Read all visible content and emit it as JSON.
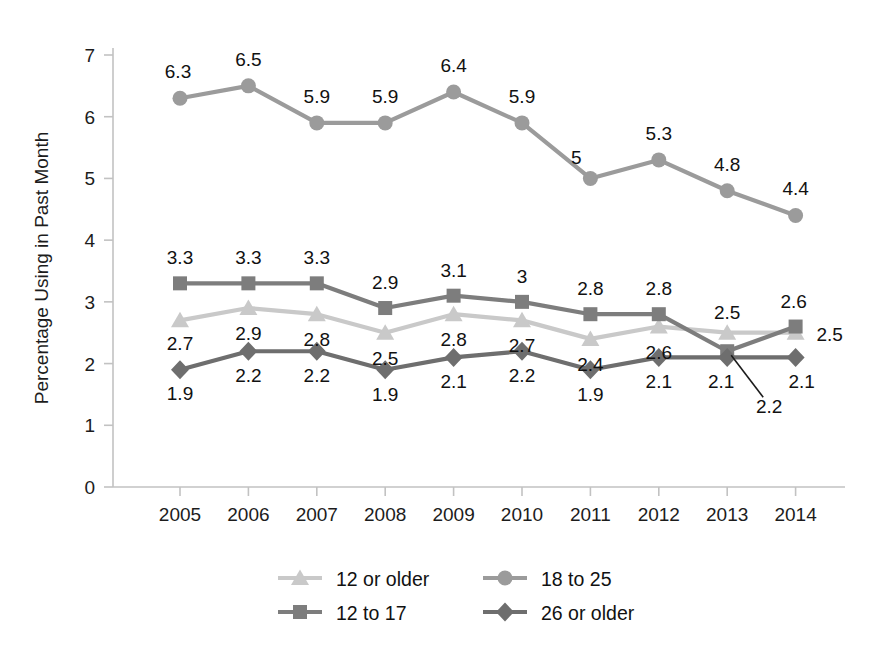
{
  "chart_data": {
    "type": "line",
    "title": "",
    "xlabel": "",
    "ylabel": "Percentage Using in Past Month",
    "categories": [
      "2005",
      "2006",
      "2007",
      "2008",
      "2009",
      "2010",
      "2011",
      "2012",
      "2013",
      "2014"
    ],
    "ylim": [
      0,
      7
    ],
    "yticks": [
      "0",
      "1",
      "2",
      "3",
      "4",
      "5",
      "6",
      "7"
    ],
    "grid": false,
    "legend_position": "bottom",
    "series": [
      {
        "name": "12 or older",
        "marker": "triangle",
        "color": "#c9c9c9",
        "values": [
          2.7,
          2.9,
          2.8,
          2.5,
          2.8,
          2.7,
          2.4,
          2.6,
          2.5,
          2.5
        ],
        "labels": [
          "2.7",
          "2.9",
          "2.8",
          "2.5",
          "2.8",
          "2.7",
          "2.4",
          "2.6",
          "2.5",
          "2.5"
        ]
      },
      {
        "name": "18 to 25",
        "marker": "circle",
        "color": "#9b9b9b",
        "values": [
          6.3,
          6.5,
          5.9,
          5.9,
          6.4,
          5.9,
          5.0,
          5.3,
          4.8,
          4.4
        ],
        "labels": [
          "6.3",
          "6.5",
          "5.9",
          "5.9",
          "6.4",
          "5.9",
          "5",
          "5.3",
          "4.8",
          "4.4"
        ]
      },
      {
        "name": "12 to 17",
        "marker": "square",
        "color": "#7d7d7d",
        "values": [
          3.3,
          3.3,
          3.3,
          2.9,
          3.1,
          3.0,
          2.8,
          2.8,
          2.2,
          2.6
        ],
        "labels": [
          "3.3",
          "3.3",
          "3.3",
          "2.9",
          "3.1",
          "3",
          "2.8",
          "2.8",
          "2.2",
          "2.6"
        ]
      },
      {
        "name": "26 or older",
        "marker": "diamond",
        "color": "#6e6e6e",
        "values": [
          1.9,
          2.2,
          2.2,
          1.9,
          2.1,
          2.2,
          1.9,
          2.1,
          2.1,
          2.1
        ],
        "labels": [
          "1.9",
          "2.2",
          "2.2",
          "1.9",
          "2.1",
          "2.2",
          "1.9",
          "2.1",
          "2.1",
          "2.1"
        ]
      }
    ],
    "legend": [
      {
        "label": "12 or older",
        "marker": "triangle",
        "color": "#c9c9c9"
      },
      {
        "label": "18 to 25",
        "marker": "circle",
        "color": "#9b9b9b"
      },
      {
        "label": "12 to 17",
        "marker": "square",
        "color": "#7d7d7d"
      },
      {
        "label": "26 or older",
        "marker": "diamond",
        "color": "#6e6e6e"
      }
    ],
    "annotations": [
      {
        "text": "2.2",
        "refers_to_series": "12 to 17",
        "refers_to_category": "2013",
        "leader_line": true
      }
    ]
  },
  "axes": {
    "y_title": "Percentage Using in Past Month",
    "y_tick_0": "0",
    "y_tick_1": "1",
    "y_tick_2": "2",
    "y_tick_3": "3",
    "y_tick_4": "4",
    "y_tick_5": "5",
    "y_tick_6": "6",
    "y_tick_7": "7",
    "x_tick_0": "2005",
    "x_tick_1": "2006",
    "x_tick_2": "2007",
    "x_tick_3": "2008",
    "x_tick_4": "2009",
    "x_tick_5": "2010",
    "x_tick_6": "2011",
    "x_tick_7": "2012",
    "x_tick_8": "2013",
    "x_tick_9": "2014"
  },
  "style": {
    "background": "#ffffff",
    "axis_color": "#bdbdbd",
    "text_color": "#1c1c1c"
  }
}
